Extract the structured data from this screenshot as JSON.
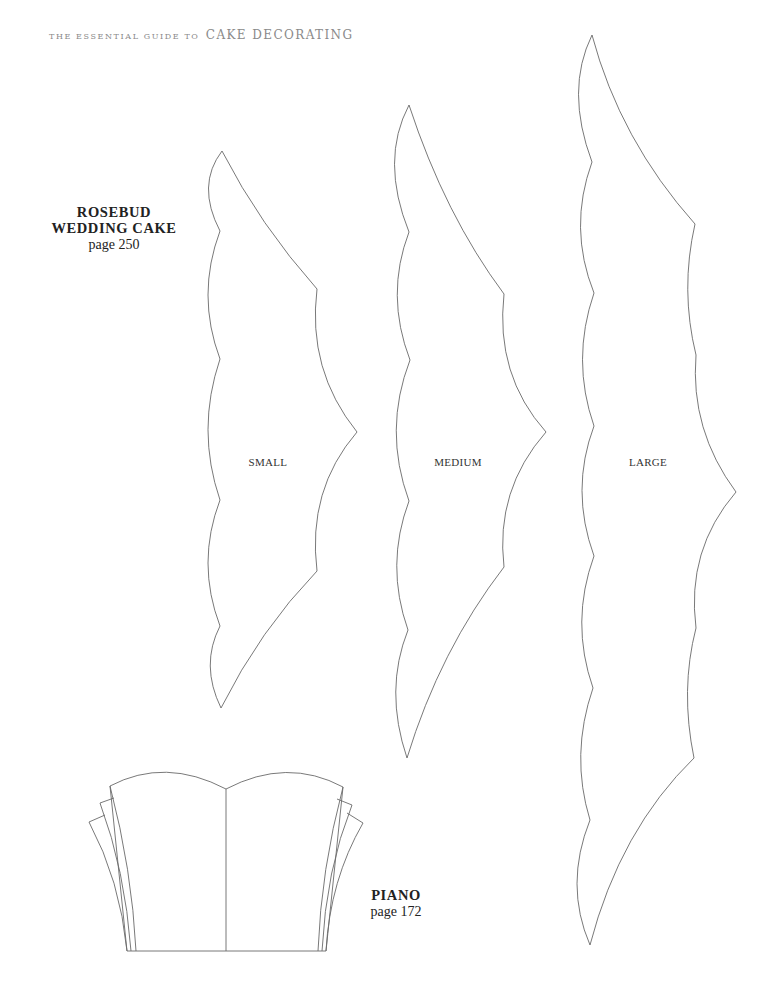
{
  "header": {
    "prefix": "The Essential Guide to",
    "title": "Cake Decorating"
  },
  "templates": [
    {
      "id": "rosebud",
      "title_line1": "ROSEBUD",
      "title_line2": "WEDDING CAKE",
      "page": "page 250"
    },
    {
      "id": "piano",
      "title_line1": "PIANO",
      "page": "page 172"
    }
  ],
  "shape_labels": {
    "small": "SMALL",
    "medium": "MEDIUM",
    "large": "LARGE"
  },
  "colors": {
    "background": "#ffffff",
    "outline": "#6a6a6a",
    "header_text": "#8a8a8a",
    "body_text": "#222222"
  }
}
